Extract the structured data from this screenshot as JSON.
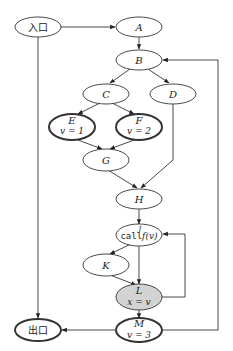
{
  "diagram": {
    "type": "control-flow-graph",
    "nodes": {
      "entry": {
        "label": "入口"
      },
      "A": {
        "label": "A"
      },
      "B": {
        "label": "B"
      },
      "C": {
        "label": "C"
      },
      "D": {
        "label": "D"
      },
      "E": {
        "label": "E",
        "sub": "v = 1"
      },
      "F": {
        "label": "F",
        "sub": "v = 2"
      },
      "G": {
        "label": "G"
      },
      "H": {
        "label": "H"
      },
      "J": {
        "label": "J",
        "call": "call",
        "fn": "f(v)"
      },
      "K": {
        "label": "K"
      },
      "L": {
        "label": "L",
        "sub": "x = v"
      },
      "M": {
        "label": "M",
        "sub": "v = 3"
      },
      "exit": {
        "label": "出口"
      }
    },
    "edges": [
      [
        "入口",
        "A"
      ],
      [
        "入口",
        "出口"
      ],
      [
        "A",
        "B"
      ],
      [
        "B",
        "C"
      ],
      [
        "B",
        "D"
      ],
      [
        "C",
        "E"
      ],
      [
        "C",
        "F"
      ],
      [
        "E",
        "G"
      ],
      [
        "F",
        "G"
      ],
      [
        "G",
        "H"
      ],
      [
        "D",
        "H"
      ],
      [
        "H",
        "J"
      ],
      [
        "J",
        "K"
      ],
      [
        "J",
        "L"
      ],
      [
        "K",
        "L"
      ],
      [
        "L",
        "J"
      ],
      [
        "L",
        "M"
      ],
      [
        "M",
        "出口"
      ],
      [
        "M",
        "B"
      ]
    ],
    "colors": {
      "stroke": "#333333",
      "highlight_fill": "#d3d3d3"
    }
  }
}
